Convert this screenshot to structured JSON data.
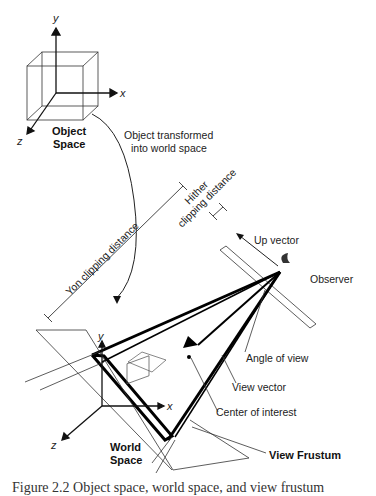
{
  "figure": {
    "object_space": {
      "label_line1": "Object",
      "label_line2": "Space",
      "axes": {
        "x": "x",
        "y": "y",
        "z": "z"
      }
    },
    "world_space": {
      "label_line1": "World",
      "label_line2": "Space",
      "axes": {
        "x": "x",
        "y": "y",
        "z": "z"
      }
    },
    "transform_label_line1": "Object transformed",
    "transform_label_line2": "into world space",
    "yon_label": "Yon clipping distance",
    "hither_label_line1": "Hither",
    "hither_label_line2": "clipping distance",
    "up_vector": "Up vector",
    "observer": "Observer",
    "angle_of_view": "Angle of  view",
    "view_vector": "View vector",
    "center_of_interest": "Center of interest",
    "view_frustum": "View Frustum",
    "caption": "Figure 2.2  Object space, world space, and view frustum"
  }
}
